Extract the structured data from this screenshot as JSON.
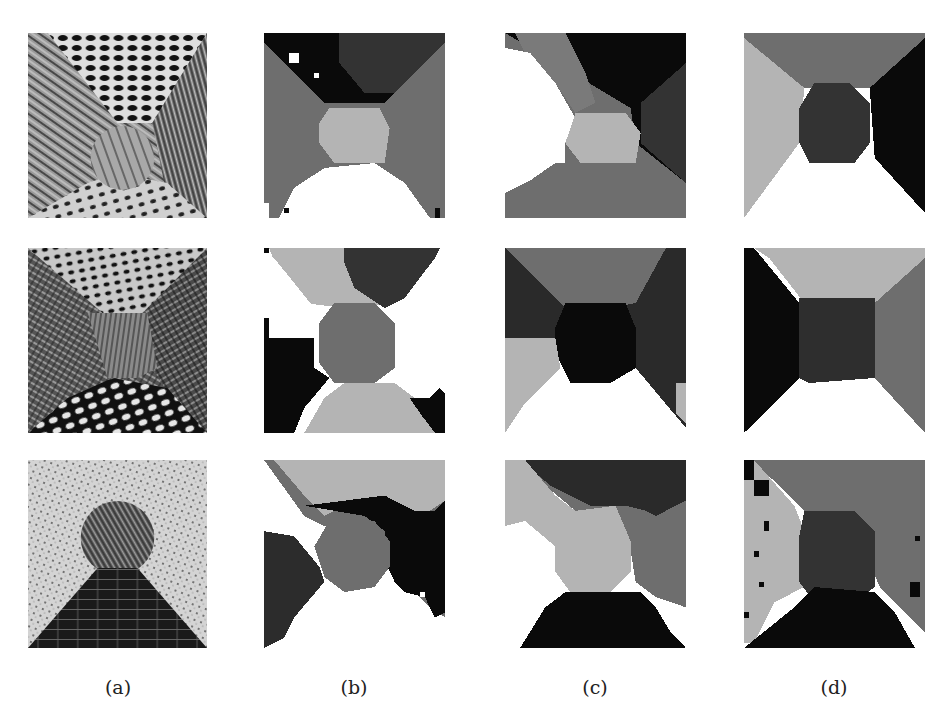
{
  "figure": {
    "columns": [
      {
        "id": "a",
        "label": "(a)",
        "description": "input texture mosaics"
      },
      {
        "id": "b",
        "label": "(b)",
        "description": "segmentation result"
      },
      {
        "id": "c",
        "label": "(c)",
        "description": "segmentation result"
      },
      {
        "id": "d",
        "label": "(d)",
        "description": "segmentation result"
      }
    ],
    "rows": [
      {
        "id": "row1",
        "description": "four-wedge texture mosaic with central circle (wood, grass, dotted textures)"
      },
      {
        "id": "row2",
        "description": "four-wedge texture mosaic with central region (perforated grid, crosshatch, dotted textures)"
      },
      {
        "id": "row3",
        "description": "textured background with circle on top of triangular brick floor"
      }
    ],
    "gray_levels": {
      "black": "#0a0a0a",
      "dark": "#3a3a3a",
      "mid": "#6e6e6e",
      "light": "#b4b4b4",
      "white": "#ffffff"
    }
  }
}
